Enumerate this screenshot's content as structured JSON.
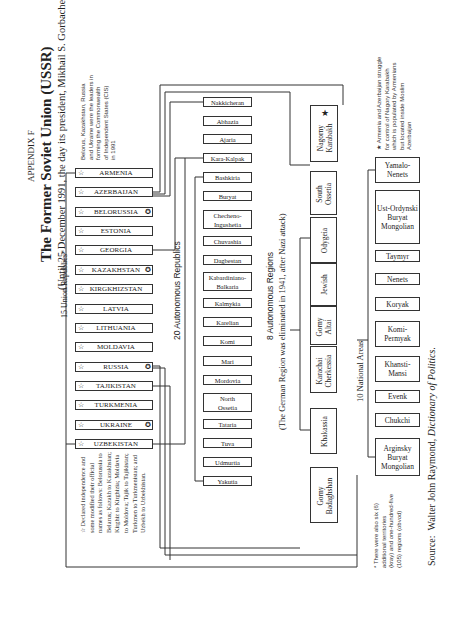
{
  "header": {
    "appendix": "APPENDIX F",
    "title": "The Former Soviet Union (USSR)",
    "subtitle": "(Until 25 December 1991, the day its president, Mikhail S. Gorbachev, resigned)"
  },
  "cis_note": {
    "icon": "cis-circle-icon",
    "text_lines": [
      "Belorus, Kazakhstan, Russia",
      "and Ukraine were the leaders in",
      "forming the Commonwealth",
      "of Independent States (CIS)",
      "in 1991"
    ]
  },
  "union_republics": {
    "label": "15 Union Republics*",
    "items": [
      {
        "name": "ARMENIA",
        "cis": false
      },
      {
        "name": "AZERBAIJAN",
        "cis": false
      },
      {
        "name": "BELORUSSIA",
        "cis": true
      },
      {
        "name": "ESTONIA",
        "cis": false
      },
      {
        "name": "GEORGIA",
        "cis": false
      },
      {
        "name": "KAZAKHSTAN",
        "cis": true
      },
      {
        "name": "KIRGKHIZSTAN",
        "cis": false
      },
      {
        "name": "LATVIA",
        "cis": false
      },
      {
        "name": "LITHUANIA",
        "cis": false
      },
      {
        "name": "MOLDAVIA",
        "cis": false
      },
      {
        "name": "RUSSIA",
        "cis": true
      },
      {
        "name": "TAJIKISTAN",
        "cis": false
      },
      {
        "name": "TURKMENIA",
        "cis": false
      },
      {
        "name": "UKRAINE",
        "cis": true
      },
      {
        "name": "UZBEKISTAN",
        "cis": false
      }
    ],
    "star_glyph": "☆",
    "cis_glyph": "✪"
  },
  "independence_note": {
    "text_lines": [
      "☆ Declared independence and",
      "some modified their official",
      "names as follows: Belorussia to",
      "Belarus; Kazakh to Kazakhstan;",
      "Kirghiz to Kirghizia; Moldavia",
      "to Moldova; Tajik to Tajikistan;",
      "Turkmen to Turkmenistan; and",
      "Uzbekh to Uzbekhistan."
    ]
  },
  "autonomous_republics": {
    "label": "20 Autonomous Republics",
    "items": [
      "Nakkicheran",
      "Abhazia",
      "Ajaria",
      "Kara-Kalpak",
      "Bashkiria",
      "Buryat",
      "Checheno-\nIngushetia",
      "Chuvashia",
      "Dagbestan",
      "Kabardiniano-\nBalkaria",
      "Kalmykia",
      "Karelian",
      "Komi",
      "Mari",
      "Mordovia",
      "North\nOssetia",
      "Tataria",
      "Tuva",
      "Udmurtia",
      "Yakutia"
    ]
  },
  "autonomous_regions": {
    "label": "8 Autonomous Regions",
    "sublabel": "(The German Region was eliminated in 1941, after Nazi attack)",
    "items": [
      "Nagorny\nKarabakh",
      "South\nOssetia",
      "Odygeia",
      "Jewish",
      "Gorny\nAltai",
      "Karachai\nCherkessia",
      "Khakassia",
      "Gorny\nBadaghshan"
    ],
    "nagorny_star": "★"
  },
  "national_areas": {
    "label": "10 National Areas",
    "items": [
      "Yamalo-Nenets",
      "Ust-Ordynski Buryat Mongolian",
      "Taymyr",
      "Nenets",
      "Koryak",
      "Komi-Permyak",
      "Khansti-Mansi",
      "Evenk",
      "Chukchi",
      "Arginsky Buryat Mongolian"
    ]
  },
  "karabakh_note": {
    "text_lines": [
      "★ Armenia and Azerbaijan struggle",
      "for control of Nagory Karabakh",
      "which is populated by Armenians",
      "but located inside Moslim",
      "Azerbaijan"
    ]
  },
  "territories_note": {
    "text_lines": [
      "* There were also six (6)",
      "additional territories",
      "(kray) and one-hundred-five",
      "(105) regions (obvod)"
    ]
  },
  "source": {
    "prefix": "Source:",
    "author": "Walter John Raymond,",
    "work": "Dictionary of Politics."
  }
}
